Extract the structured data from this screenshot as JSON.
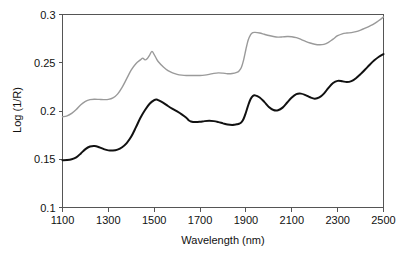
{
  "chart_data": {
    "type": "line",
    "title": "",
    "xlabel": "Wavelength (nm)",
    "ylabel": "Log (1/R)",
    "xlim": [
      1100,
      2500
    ],
    "ylim": [
      0.1,
      0.3
    ],
    "xticks": [
      1100,
      1300,
      1500,
      1700,
      1900,
      2100,
      2300,
      2500
    ],
    "xtick_labels": [
      "1100",
      "1300",
      "1500",
      "1700",
      "1900",
      "2100",
      "2300",
      "2500"
    ],
    "yticks": [
      0.1,
      0.15,
      0.2,
      0.25,
      0.3
    ],
    "ytick_labels": [
      "0.1",
      "0.15",
      "0.2",
      "0.25",
      "0.3"
    ],
    "grid": false,
    "legend": "none",
    "frame": "box",
    "series": [
      {
        "name": "upper-spectrum",
        "color": "#9a9a9a",
        "width": 1.4,
        "x": [
          1100,
          1120,
          1140,
          1160,
          1180,
          1200,
          1220,
          1240,
          1260,
          1280,
          1300,
          1320,
          1340,
          1360,
          1380,
          1400,
          1420,
          1440,
          1450,
          1460,
          1470,
          1480,
          1490,
          1500,
          1510,
          1520,
          1540,
          1560,
          1580,
          1600,
          1620,
          1640,
          1660,
          1680,
          1700,
          1720,
          1740,
          1760,
          1780,
          1800,
          1820,
          1840,
          1860,
          1870,
          1880,
          1890,
          1900,
          1910,
          1920,
          1930,
          1940,
          1960,
          1980,
          2000,
          2020,
          2040,
          2060,
          2080,
          2100,
          2120,
          2140,
          2160,
          2180,
          2200,
          2220,
          2240,
          2260,
          2280,
          2300,
          2320,
          2340,
          2360,
          2380,
          2400,
          2420,
          2440,
          2460,
          2480,
          2500
        ],
        "y": [
          0.194,
          0.195,
          0.1975,
          0.2015,
          0.2065,
          0.21,
          0.2118,
          0.2122,
          0.212,
          0.2118,
          0.212,
          0.2135,
          0.2175,
          0.2245,
          0.2335,
          0.2425,
          0.249,
          0.253,
          0.2548,
          0.253,
          0.2545,
          0.258,
          0.2618,
          0.2585,
          0.254,
          0.2505,
          0.2455,
          0.2418,
          0.2395,
          0.238,
          0.2372,
          0.2368,
          0.2368,
          0.2368,
          0.2368,
          0.2372,
          0.238,
          0.239,
          0.2395,
          0.2392,
          0.2386,
          0.2388,
          0.24,
          0.2415,
          0.245,
          0.253,
          0.264,
          0.2735,
          0.279,
          0.2812,
          0.2815,
          0.2808,
          0.2795,
          0.2782,
          0.2772,
          0.2766,
          0.2768,
          0.2772,
          0.277,
          0.276,
          0.2742,
          0.2722,
          0.2705,
          0.2692,
          0.2686,
          0.269,
          0.271,
          0.2745,
          0.278,
          0.28,
          0.2808,
          0.2812,
          0.2822,
          0.2838,
          0.2858,
          0.288,
          0.2905,
          0.2938,
          0.2975
        ]
      },
      {
        "name": "lower-spectrum",
        "color": "#111111",
        "width": 2.0,
        "x": [
          1100,
          1120,
          1140,
          1160,
          1180,
          1200,
          1220,
          1240,
          1260,
          1280,
          1300,
          1320,
          1340,
          1360,
          1380,
          1400,
          1420,
          1440,
          1460,
          1480,
          1500,
          1510,
          1520,
          1540,
          1560,
          1580,
          1600,
          1620,
          1640,
          1650,
          1660,
          1680,
          1700,
          1720,
          1740,
          1760,
          1780,
          1800,
          1820,
          1840,
          1850,
          1860,
          1870,
          1880,
          1890,
          1900,
          1910,
          1920,
          1930,
          1940,
          1960,
          1980,
          2000,
          2020,
          2040,
          2060,
          2080,
          2100,
          2120,
          2140,
          2160,
          2180,
          2200,
          2220,
          2240,
          2260,
          2280,
          2300,
          2320,
          2340,
          2360,
          2380,
          2400,
          2420,
          2440,
          2460,
          2480,
          2500
        ],
        "y": [
          0.149,
          0.1492,
          0.15,
          0.152,
          0.156,
          0.1605,
          0.1632,
          0.1638,
          0.1625,
          0.1605,
          0.1592,
          0.159,
          0.16,
          0.1625,
          0.1668,
          0.1735,
          0.183,
          0.193,
          0.201,
          0.2075,
          0.2112,
          0.2118,
          0.211,
          0.2085,
          0.2052,
          0.2022,
          0.1995,
          0.1965,
          0.193,
          0.1905,
          0.1892,
          0.1885,
          0.1888,
          0.1895,
          0.1898,
          0.1895,
          0.1885,
          0.1872,
          0.186,
          0.1855,
          0.1858,
          0.1862,
          0.1868,
          0.1882,
          0.192,
          0.1985,
          0.206,
          0.2122,
          0.2155,
          0.2162,
          0.214,
          0.2095,
          0.2042,
          0.201,
          0.2008,
          0.2035,
          0.2088,
          0.214,
          0.2175,
          0.218,
          0.2165,
          0.2142,
          0.2128,
          0.214,
          0.218,
          0.224,
          0.229,
          0.2312,
          0.2308,
          0.23,
          0.231,
          0.234,
          0.2382,
          0.243,
          0.248,
          0.2525,
          0.2562,
          0.259
        ]
      }
    ]
  },
  "axes": {
    "xlabel": "Wavelength (nm)",
    "ylabel": "Log (1/R)"
  }
}
